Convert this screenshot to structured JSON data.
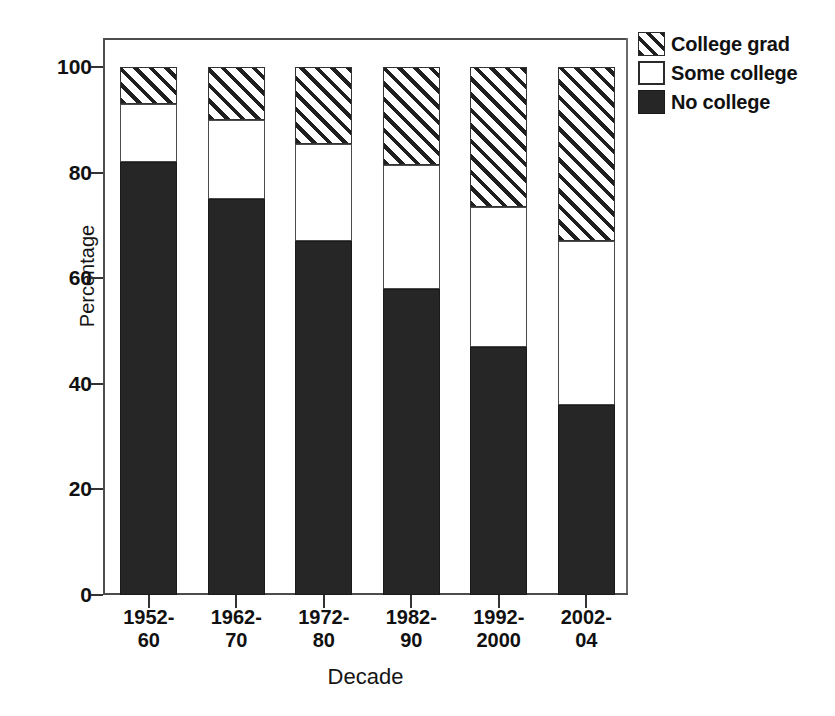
{
  "chart_data": {
    "type": "bar",
    "subtype": "stacked-bar-100-percent",
    "title": "",
    "xlabel": "Decade",
    "ylabel": "Percentage",
    "categories": [
      "1952-60",
      "1962-70",
      "1972-80",
      "1982-90",
      "1992-2000",
      "2002-04"
    ],
    "category_lines": [
      [
        "1952-",
        "60"
      ],
      [
        "1962-",
        "70"
      ],
      [
        "1972-",
        "80"
      ],
      [
        "1982-",
        "90"
      ],
      [
        "1992-",
        "2000"
      ],
      [
        "2002-",
        "04"
      ]
    ],
    "series": [
      {
        "name": "No college",
        "fill": "solid-black",
        "color": "#262626",
        "values": [
          82,
          75,
          67,
          58,
          47,
          36
        ]
      },
      {
        "name": "Some college",
        "fill": "white",
        "color": "#ffffff",
        "values": [
          11,
          15,
          18.5,
          23.5,
          26.5,
          31
        ]
      },
      {
        "name": "College grad",
        "fill": "diagonal-hatch",
        "color": "#1f1f1f",
        "values": [
          7,
          10,
          14.5,
          18.5,
          26.5,
          33
        ]
      }
    ],
    "cumulative_tops": {
      "no_college": [
        82,
        75,
        67,
        58,
        47,
        36
      ],
      "some_college": [
        93,
        90,
        85.5,
        81.5,
        73.5,
        67
      ],
      "college_grad": [
        100,
        100,
        100,
        100,
        100,
        100
      ]
    },
    "ylim": [
      0,
      100
    ],
    "yticks": [
      0,
      20,
      40,
      60,
      80,
      100
    ],
    "ytick_labels": [
      "0",
      "20",
      "40",
      "60",
      "80",
      "100"
    ],
    "grid": false,
    "legend_position": "top-right-outside",
    "legend_entries": [
      "College grad",
      "Some college",
      "No college"
    ]
  },
  "axes": {
    "y_title": "Percentage",
    "x_title": "Decade"
  },
  "legend": {
    "items": [
      {
        "label": "College grad",
        "swatch": "hatch-swatch"
      },
      {
        "label": "Some college",
        "swatch": "white-swatch"
      },
      {
        "label": "No college",
        "swatch": "black-swatch"
      }
    ]
  }
}
